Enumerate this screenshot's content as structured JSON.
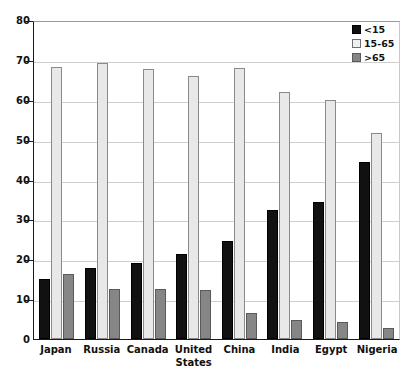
{
  "chart_data": {
    "type": "bar",
    "title": "",
    "subtitle": "",
    "xlabel": "",
    "ylabel": "",
    "ylim": [
      0,
      80
    ],
    "yticks": [
      0,
      10,
      20,
      30,
      40,
      50,
      60,
      70,
      80
    ],
    "grid": true,
    "legend_position": "top-right",
    "categories": [
      "Japan",
      "Russia",
      "Canada",
      "United States",
      "China",
      "India",
      "Egypt",
      "Nigeria"
    ],
    "series": [
      {
        "name": "<15",
        "color": "#111111",
        "values": [
          15.1,
          17.9,
          19.1,
          21.3,
          24.5,
          32.3,
          34.3,
          44.4
        ]
      },
      {
        "name": "15-65",
        "color": "#e8e8e8",
        "values": [
          68.1,
          69.2,
          67.8,
          66.0,
          68.0,
          62.0,
          60.0,
          51.6
        ]
      },
      {
        "name": ">65",
        "color": "#868686",
        "values": [
          16.3,
          12.6,
          12.5,
          12.2,
          6.6,
          4.8,
          4.2,
          2.8
        ]
      }
    ]
  },
  "legend": {
    "items": [
      {
        "label": "<15"
      },
      {
        "label": "15-65"
      },
      {
        "label": ">65"
      }
    ]
  },
  "axis": {
    "y_tick_labels": [
      "0",
      "10",
      "20",
      "30",
      "40",
      "50",
      "60",
      "70",
      "80"
    ]
  }
}
